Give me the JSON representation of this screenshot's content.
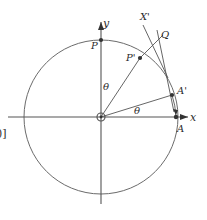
{
  "figure": {
    "title": "",
    "type": "geometry-diagram",
    "stroke_color": "#4a4a4a",
    "label_color": "#2b2b2b",
    "background": "#ffffff",
    "circle": {
      "cx": 101,
      "cy": 117,
      "r": 77
    },
    "axes": {
      "x_label": "x",
      "y_label": "y",
      "x_arrow": true,
      "y_arrow": true
    },
    "points": [
      {
        "id": "origin",
        "label": "",
        "x": 101,
        "y": 117,
        "marker": "ring"
      },
      {
        "id": "P",
        "label": "P",
        "x": 101,
        "y": 40,
        "marker": "dot"
      },
      {
        "id": "Pp",
        "label": "P'",
        "x": 140,
        "y": 58,
        "marker": "dot"
      },
      {
        "id": "A",
        "label": "A",
        "x": 176,
        "y": 117,
        "marker": "dot"
      },
      {
        "id": "Ap",
        "label": "A'",
        "x": 172,
        "y": 95,
        "marker": "dot"
      },
      {
        "id": "Q",
        "label": "Q",
        "x": 162,
        "y": 40,
        "marker": "none"
      },
      {
        "id": "Xp",
        "label": "X'",
        "x": 145,
        "y": 17,
        "marker": "none"
      }
    ],
    "angle_labels": [
      {
        "id": "theta-upper",
        "text": "θ",
        "x": 103,
        "y": 86
      },
      {
        "id": "theta-lower",
        "text": "θ",
        "x": 136,
        "y": 111
      }
    ],
    "edge_fragment": {
      "text": "0)]",
      "x": -4,
      "y": 130
    }
  }
}
